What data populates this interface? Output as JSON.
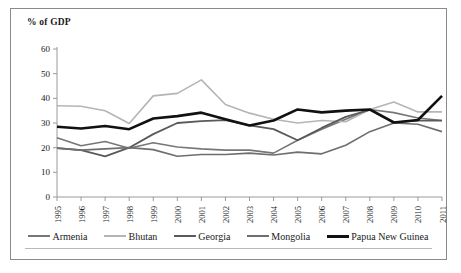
{
  "chart_data": {
    "type": "line",
    "title": "",
    "xlabel": "",
    "ylabel": "% of GDP",
    "ylim": [
      0,
      60
    ],
    "ytick_step": 10,
    "yticks": [
      0,
      10,
      20,
      30,
      40,
      50,
      60
    ],
    "grid": false,
    "legend_position": "bottom",
    "categories": [
      "1995",
      "1996",
      "1997",
      "1998",
      "1999",
      "2000",
      "2001",
      "2002",
      "2003",
      "2004",
      "2005",
      "2006",
      "2007",
      "2008",
      "2009",
      "2010",
      "2011"
    ],
    "series": [
      {
        "name": "Armenia",
        "color": "#777777",
        "width": 1.6,
        "values": [
          24.0,
          20.8,
          22.5,
          19.8,
          22.0,
          20.3,
          19.5,
          19.0,
          19.0,
          17.8,
          23.0,
          27.5,
          31.5,
          35.5,
          34.2,
          32.0,
          31.0
        ]
      },
      {
        "name": "Bhutan",
        "color": "#b5b5b5",
        "width": 1.6,
        "values": [
          37.0,
          36.8,
          35.0,
          29.8,
          41.0,
          42.0,
          47.5,
          37.5,
          34.0,
          31.5,
          30.0,
          31.0,
          30.5,
          35.5,
          38.5,
          34.5,
          34.5
        ]
      },
      {
        "name": "Georgia",
        "color": "#5a5a5a",
        "width": 1.8,
        "values": [
          19.8,
          19.0,
          16.5,
          20.0,
          25.5,
          30.0,
          30.8,
          31.2,
          29.0,
          27.5,
          23.0,
          28.0,
          32.5,
          35.3,
          30.2,
          31.0,
          31.0
        ]
      },
      {
        "name": "Mongolia",
        "color": "#6e6e6e",
        "width": 1.6,
        "values": [
          19.8,
          19.0,
          19.5,
          20.0,
          19.2,
          16.5,
          17.2,
          17.2,
          17.8,
          17.0,
          18.2,
          17.5,
          21.0,
          26.5,
          30.0,
          29.5,
          26.5
        ]
      },
      {
        "name": "Papua New Guinea",
        "color": "#111111",
        "width": 2.6,
        "values": [
          28.5,
          27.8,
          28.8,
          27.5,
          31.8,
          32.8,
          34.2,
          31.5,
          29.0,
          31.0,
          35.5,
          34.3,
          35.0,
          35.5,
          30.2,
          31.2,
          41.0
        ]
      }
    ]
  },
  "legend": {
    "items": [
      {
        "label": "Armenia"
      },
      {
        "label": "Bhutan"
      },
      {
        "label": "Georgia"
      },
      {
        "label": "Mongolia"
      },
      {
        "label": "Papua New Guinea"
      }
    ]
  }
}
